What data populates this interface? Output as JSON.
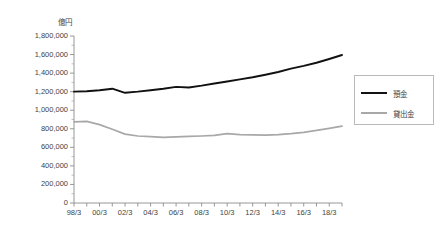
{
  "chart_data": {
    "type": "line",
    "title": "",
    "unit_label": "億円",
    "xlabel": "",
    "ylabel": "",
    "ylim": [
      0,
      1800000
    ],
    "ytick_values": [
      0,
      200000,
      400000,
      600000,
      800000,
      1000000,
      1200000,
      1400000,
      1600000,
      1800000
    ],
    "ytick_labels": [
      "0",
      "200,000",
      "400,000",
      "600,000",
      "800,000",
      "1,000,000",
      "1,200,000",
      "1,400,000",
      "1,600,000",
      "1,800,000"
    ],
    "grid": false,
    "legend_position": "right",
    "categories": [
      "98/3",
      "99/3",
      "00/3",
      "01/3",
      "02/3",
      "03/3",
      "04/3",
      "05/3",
      "06/3",
      "07/3",
      "08/3",
      "09/3",
      "10/3",
      "11/3",
      "12/3",
      "13/3",
      "14/3",
      "15/3",
      "16/3",
      "17/3",
      "18/3",
      "19/3"
    ],
    "xtick_labels_shown": [
      "98/3",
      "00/3",
      "02/3",
      "04/3",
      "06/3",
      "08/3",
      "10/3",
      "12/3",
      "14/3",
      "16/3",
      "18/3"
    ],
    "series": [
      {
        "name": "預金",
        "color": "#111111",
        "values": [
          1200000,
          1205000,
          1215000,
          1232000,
          1188000,
          1200000,
          1215000,
          1232000,
          1252000,
          1245000,
          1265000,
          1288000,
          1310000,
          1332000,
          1355000,
          1382000,
          1412000,
          1448000,
          1478000,
          1512000,
          1552000,
          1595000
        ]
      },
      {
        "name": "貸出金",
        "color": "#a8a8a8",
        "values": [
          875000,
          880000,
          845000,
          795000,
          742000,
          722000,
          715000,
          708000,
          712000,
          718000,
          722000,
          728000,
          748000,
          738000,
          735000,
          732000,
          738000,
          748000,
          762000,
          782000,
          805000,
          828000
        ]
      }
    ]
  },
  "legend": {
    "items": [
      {
        "label": "預金",
        "color": "#111111"
      },
      {
        "label": "貸出金",
        "color": "#a8a8a8"
      }
    ]
  }
}
